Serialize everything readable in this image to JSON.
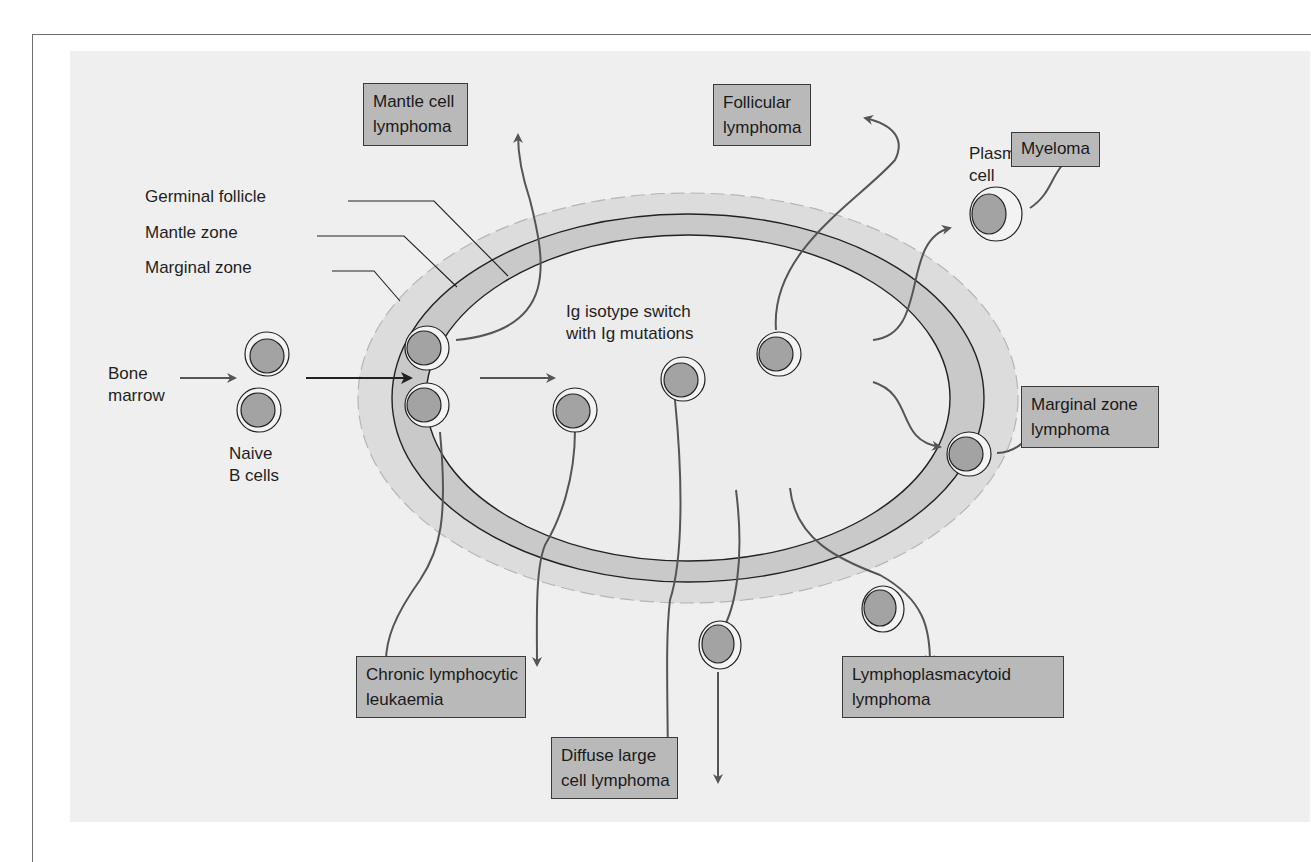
{
  "figure": {
    "zones": {
      "germinal_follicle": "Germinal follicle",
      "mantle_zone": "Mantle zone",
      "marginal_zone": "Marginal zone"
    },
    "labels": {
      "bone_marrow_line1": "Bone",
      "bone_marrow_line2": "marrow",
      "naive_line1": "Naive",
      "naive_line2": "B cells",
      "switch_line1": "Ig isotype switch",
      "switch_line2": "with Ig mutations",
      "plasma_line1": "Plasma",
      "plasma_line2": "cell"
    },
    "outcomes": {
      "mantle_cell": {
        "line1": "Mantle cell",
        "line2": "lymphoma"
      },
      "follicular": {
        "line1": "Follicular",
        "line2": "lymphoma"
      },
      "myeloma": {
        "line1": "Myeloma"
      },
      "marginal_zone": {
        "line1": "Marginal zone",
        "line2": "lymphoma"
      },
      "cll": {
        "line1": "Chronic lymphocytic",
        "line2": "leukaemia"
      },
      "dlbcl": {
        "line1": "Diffuse large",
        "line2": "cell lymphoma"
      },
      "lymphoplasmacytoid": {
        "line1": "Lymphoplasmacytoid",
        "line2": "lymphoma"
      }
    },
    "colors": {
      "panel": "#efefef",
      "marginal_zone": "#dcdcdc",
      "mantle_zone": "#c9c9c9",
      "follicle": "#ececec",
      "nucleus": "#a3a3a3",
      "box_fill": "#b9b9b9",
      "arrow": "#555555"
    }
  }
}
